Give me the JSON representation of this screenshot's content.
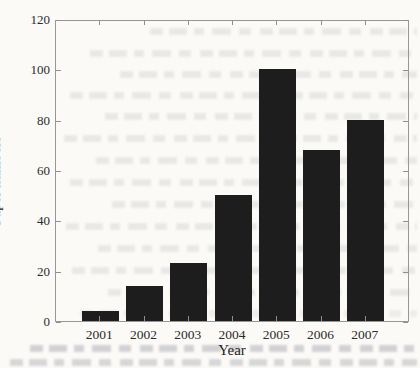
{
  "figure": {
    "background_color": "#fbfaf7",
    "bar_color": "#1d1d1d",
    "axis_color": "#979797",
    "label_color": "#242424"
  },
  "chart_data": {
    "type": "bar",
    "title": "",
    "xlabel": "Year",
    "ylabel": "Paper numbers",
    "categories": [
      "2001",
      "2002",
      "2003",
      "2004",
      "2005",
      "2006",
      "2007"
    ],
    "values": [
      4,
      14,
      23,
      50,
      100,
      68,
      80
    ],
    "ylim": [
      0,
      120
    ],
    "yticks": [
      0,
      20,
      40,
      60,
      80,
      100,
      120
    ],
    "grid": false,
    "legend_position": "none",
    "box": true
  }
}
